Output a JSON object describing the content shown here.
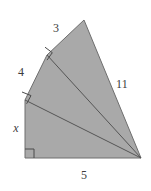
{
  "figure": {
    "kind": "geometry-diagram",
    "fill_color": "#a9a9a9",
    "stroke_color": "#6e6e6e",
    "label_color": "#3c3c3c",
    "background_color": "#ffffff",
    "labels": [
      {
        "id": "3",
        "text": "3",
        "style": "roman",
        "x": 56,
        "y": 28
      },
      {
        "id": "4",
        "text": "4",
        "style": "roman",
        "x": 21,
        "y": 72
      },
      {
        "id": "11",
        "text": "11",
        "style": "roman",
        "x": 122,
        "y": 84
      },
      {
        "id": "x",
        "text": "x",
        "style": "italic",
        "x": 16,
        "y": 128
      },
      {
        "id": "5",
        "text": "5",
        "style": "roman",
        "x": 84,
        "y": 175
      }
    ],
    "vertices": {
      "top": "84,20",
      "upper_left": "47,55",
      "mid_left": "25,100",
      "bottom_left": "25,158",
      "bottom_right": "141,158"
    },
    "outline_points": "84,20 47,55 25,100 25,158 141,158",
    "internal_segments": [
      "47,55 141,158",
      "25,100 141,158"
    ],
    "right_angle_markers": [
      {
        "at": "47,55",
        "size": 8
      },
      {
        "at": "25,100",
        "size": 8
      },
      {
        "at": "25,158",
        "size": 9
      }
    ],
    "side_lengths": {
      "top_left_edge": "3",
      "left_upper_edge": "4",
      "right_edge": "11",
      "left_lower_edge": "x",
      "bottom_edge": "5"
    }
  }
}
